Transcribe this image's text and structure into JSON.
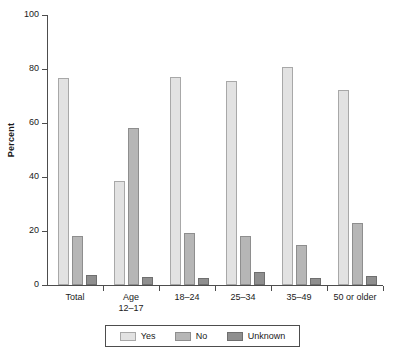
{
  "chart_data": {
    "type": "bar",
    "title": "",
    "subtitle": "",
    "xlabel": "",
    "ylabel": "Percent",
    "ylim": [
      0,
      100
    ],
    "yticks": [
      0,
      20,
      40,
      60,
      80,
      100
    ],
    "ytick_labels": [
      "0",
      "20",
      "40",
      "60",
      "80",
      "100"
    ],
    "grid": false,
    "legend_position": "bottom",
    "categories": [
      "Total",
      "Age\n12–17",
      "18–24",
      "25–34",
      "35–49",
      "50 or older"
    ],
    "category_labels": [
      "Total",
      "Age 12–17",
      "18–24",
      "25–34",
      "35–49",
      "50 or older"
    ],
    "series": [
      {
        "name": "Yes",
        "color": "#e2e2e2",
        "values": [
          76.8,
          38.6,
          77.2,
          75.6,
          80.8,
          72.4
        ]
      },
      {
        "name": "No",
        "color": "#b6b6b6",
        "values": [
          18.3,
          58.0,
          19.4,
          18.2,
          14.8,
          23.1
        ]
      },
      {
        "name": "Unknown",
        "color": "#8f8f8f",
        "values": [
          3.7,
          2.9,
          2.7,
          4.8,
          2.6,
          3.4
        ]
      }
    ]
  },
  "legend": {
    "items": [
      {
        "label": "Yes"
      },
      {
        "label": "No"
      },
      {
        "label": "Unknown"
      }
    ]
  }
}
